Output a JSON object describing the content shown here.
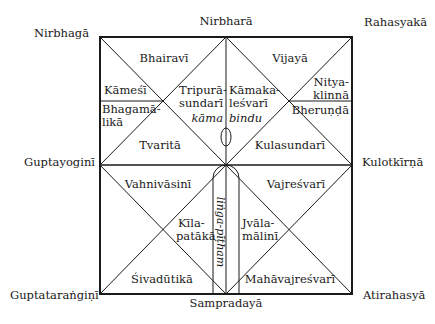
{
  "diagram": {
    "outer_labels": {
      "top_left": "Nirbhagā",
      "top_center": "Nirbharā",
      "top_right": "Rahasyakā",
      "middle_left": "Guptayoginī",
      "middle_right": "Kulotkīrṇā",
      "bottom_left": "Guptataraṅgiṇī",
      "bottom_center": "Sampradayā",
      "bottom_right": "Atirahasyā"
    },
    "upper_half": {
      "bhairavi": "Bhairavī",
      "vijaya": "Vijayā",
      "kamesi": "Kāmeśī",
      "bhagamalika_1": "Bhagamā-",
      "bhagamalika_2": "likā",
      "tripurasundari_1": "Tripurā-",
      "tripurasundari_2": "sundarī",
      "kamakalesvari_1": "Kāmaka-",
      "kamakalesvari_2": "leśvarī",
      "nityaklinna_1": "Nitya-",
      "nityaklinna_2": "klinnā",
      "bherunda": "Bheruṇḍā",
      "tvarita": "Tvaritā",
      "kulasundari": "Kulasundarī",
      "kama": "kāma",
      "bindu": "bindu"
    },
    "lower_half": {
      "vahnivasini": "Vahnivāsinī",
      "vajresvari": "Vajreśvarī",
      "kilapataka_1": "Kīla-",
      "kilapataka_2": "patākā",
      "jvalamalini_1": "Jvāla-",
      "jvalamalini_2": "mālinī",
      "sivadutika": "Śivadūtikā",
      "mahavajresvari": "Mahāvajreśvarī",
      "linga_pitham": "liṅga-pīṭham"
    },
    "colors": {
      "line": "#1a1a1a",
      "background": "#ffffff"
    }
  }
}
